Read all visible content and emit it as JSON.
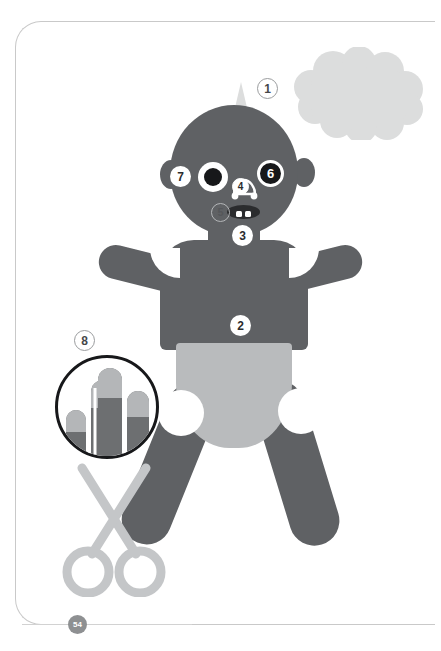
{
  "page": {
    "number": "54",
    "background_color": "#ffffff",
    "frame_color": "#c9c9c9"
  },
  "colors": {
    "figure_body": "#5f6164",
    "diaper": "#b9bbbd",
    "thought_bubble": "#dcdddd",
    "pupil": "#17181a",
    "mouth": "#2b2c2e",
    "scissors": "#c4c6c8",
    "inset_outline": "#17181a",
    "page_number_badge": "#8e9092"
  },
  "figure": {
    "name": "baby-figure",
    "parts": {
      "hair_tuft": "hair-tuft",
      "head": "head",
      "ear_left": "ear-left",
      "ear_right": "ear-right",
      "neck": "neck",
      "torso": "torso",
      "arm_left": "arm-left",
      "arm_right": "arm-right",
      "diaper": "diaper",
      "leg_left": "leg-left",
      "leg_right": "leg-right",
      "eye_left": "eye-left",
      "nose": "nose",
      "mouth": "mouth"
    }
  },
  "thought_bubble": {
    "name": "thought-bubble",
    "shape": "cloud",
    "fill": "#dcdddd"
  },
  "callouts": [
    {
      "id": "1",
      "label": "1",
      "style": "light",
      "target": "hair"
    },
    {
      "id": "2",
      "label": "2",
      "style": "white-solid",
      "target": "tummy"
    },
    {
      "id": "3",
      "label": "3",
      "style": "white-solid",
      "target": "chin"
    },
    {
      "id": "4",
      "label": "4",
      "style": "onwhite",
      "target": "nose"
    },
    {
      "id": "5",
      "label": "5",
      "style": "ring",
      "target": "cheek"
    },
    {
      "id": "6",
      "label": "6",
      "style": "dark",
      "target": "eye"
    },
    {
      "id": "7",
      "label": "7",
      "style": "white-solid",
      "target": "ear"
    },
    {
      "id": "8",
      "label": "8",
      "style": "light",
      "target": "fingernails"
    }
  ],
  "inset": {
    "name": "fingernail-inset",
    "shape": "circle",
    "outline_color": "#17181a",
    "finger_count": 4,
    "finger_fill": "#6d6f71",
    "nail_fill": "#b4b6b8",
    "fingers": [
      {
        "index": 0,
        "height": 46,
        "nail_height": 14
      },
      {
        "index": 1,
        "height": 84,
        "nail_height": 18
      },
      {
        "index": 2,
        "height": 96,
        "nail_height": 20
      },
      {
        "index": 3,
        "height": 72,
        "nail_height": 17
      }
    ]
  },
  "scissors": {
    "name": "scissors-icon",
    "stroke_color": "#c4c6c8",
    "stroke_width": 9
  }
}
